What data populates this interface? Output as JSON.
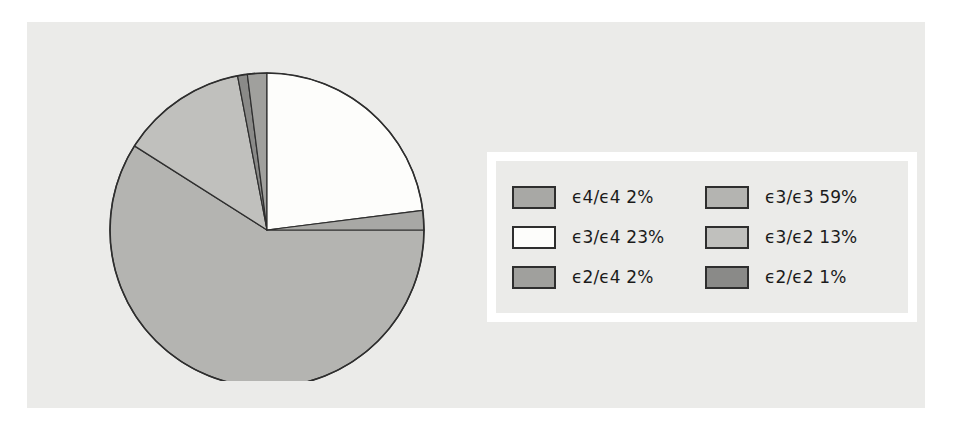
{
  "figure": {
    "background_color": "#ffffff",
    "panel_color": "#ebebe9",
    "outline_color": "#2e2e2e"
  },
  "legend": {
    "background_color": "#ebebe9",
    "border_color": "#ffffff",
    "columns": [
      {
        "items": [
          {
            "label": "ϵ4/ϵ4 2%",
            "color": "#a8a8a5",
            "value": 2,
            "name": "ϵ4/ϵ4"
          },
          {
            "label": "ϵ3/ϵ4 23%",
            "color": "#fdfdfb",
            "value": 23,
            "name": "ϵ3/ϵ4"
          },
          {
            "label": "ϵ2/ϵ4 2%",
            "color": "#a0a09d",
            "value": 2,
            "name": "ϵ2/ϵ4"
          }
        ]
      },
      {
        "items": [
          {
            "label": "ϵ3/ϵ3 59%",
            "color": "#b4b4b1",
            "value": 59,
            "name": "ϵ3/ϵ3"
          },
          {
            "label": "ϵ3/ϵ2 13%",
            "color": "#c0c0bd",
            "value": 13,
            "name": "ϵ3/ϵ2"
          },
          {
            "label": "ϵ2/ϵ2 1%",
            "color": "#8a8a88",
            "value": 1,
            "name": "ϵ2/ϵ2"
          }
        ]
      }
    ]
  },
  "chart_data": {
    "type": "pie",
    "title": "",
    "xlabel": "",
    "ylabel": "",
    "legend_position": "right",
    "grid": false,
    "start_angle_deg": 0,
    "direction": "clockwise",
    "total_percent": 100,
    "center": {
      "x": 185,
      "y": 179,
      "radius": 157
    },
    "categories": [
      "ϵ3/ϵ3",
      "ϵ3/ϵ2",
      "ϵ2/ϵ2",
      "ϵ2/ϵ4",
      "ϵ3/ϵ4",
      "ϵ4/ϵ4"
    ],
    "values": [
      59,
      13,
      1,
      2,
      23,
      2
    ],
    "slices": [
      {
        "label": "ϵ3/ϵ3",
        "value": 59,
        "color": "#b4b4b1"
      },
      {
        "label": "ϵ3/ϵ2",
        "value": 13,
        "color": "#c0c0bd"
      },
      {
        "label": "ϵ2/ϵ2",
        "value": 1,
        "color": "#8a8a88"
      },
      {
        "label": "ϵ2/ϵ4",
        "value": 2,
        "color": "#a0a09d"
      },
      {
        "label": "ϵ3/ϵ4",
        "value": 23,
        "color": "#fdfdfb"
      },
      {
        "label": "ϵ4/ϵ4",
        "value": 2,
        "color": "#a8a8a5"
      }
    ]
  }
}
